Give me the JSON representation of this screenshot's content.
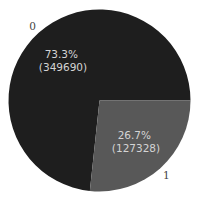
{
  "chart_data": {
    "type": "pie",
    "title": "",
    "categories": [
      "0",
      "1"
    ],
    "values": [
      349690,
      127328
    ],
    "percentages": [
      "73.3%",
      "26.7%"
    ],
    "colors": [
      "#1e1e1e",
      "#585858"
    ],
    "startangle": 0,
    "counterclock": true,
    "labels": [
      {
        "category": "0",
        "pct_text": "73.3%",
        "count_text": "(349690)"
      },
      {
        "category": "1",
        "pct_text": "26.7%",
        "count_text": "(127328)"
      }
    ],
    "legend": "none"
  }
}
